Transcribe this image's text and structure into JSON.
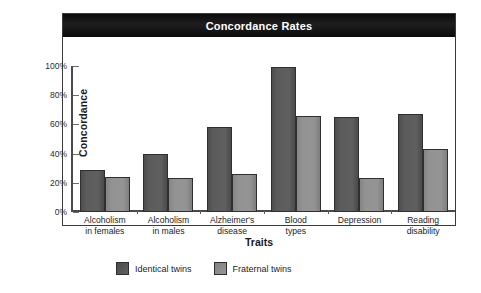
{
  "chart_data": {
    "type": "bar",
    "title": "Concordance Rates",
    "xlabel": "Traits",
    "ylabel": "Concordance",
    "ylim": [
      0,
      100
    ],
    "yticks": [
      "0%",
      "20%",
      "40%",
      "60%",
      "80%",
      "100%"
    ],
    "ytick_values": [
      0,
      20,
      40,
      60,
      80,
      100
    ],
    "grid": false,
    "legend_position": "bottom-left",
    "categories": [
      "Alcoholism in females",
      "Alcoholism in males",
      "Alzheimer's disease",
      "Blood types",
      "Depression",
      "Reading disability"
    ],
    "category_lines": [
      [
        "Alcoholism",
        "in females"
      ],
      [
        "Alcoholism",
        "in males"
      ],
      [
        "Alzheimer's",
        "disease"
      ],
      [
        "Blood",
        "types"
      ],
      [
        "Depression",
        ""
      ],
      [
        "Reading",
        "disability"
      ]
    ],
    "series": [
      {
        "name": "Identical twins",
        "color": "#585858",
        "values": [
          29,
          40,
          58,
          99,
          65,
          67
        ]
      },
      {
        "name": "Fraternal twins",
        "color": "#8d8d8d",
        "values": [
          24,
          23,
          26,
          66,
          23,
          43
        ]
      }
    ]
  },
  "legend": {
    "items": [
      {
        "label": "Identical twins",
        "color": "#585858"
      },
      {
        "label": "Fraternal twins",
        "color": "#8d8d8d"
      }
    ]
  }
}
